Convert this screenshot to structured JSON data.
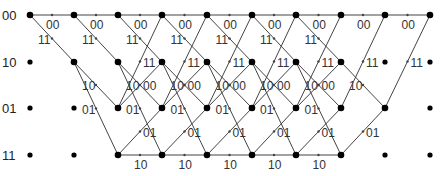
{
  "colors": {
    "line": "#444444",
    "node": "#000000",
    "text": "#333333"
  },
  "states": [
    "00",
    "10",
    "01",
    "11"
  ],
  "state_y": [
    15,
    62,
    108,
    155
  ],
  "columns_x": [
    30,
    74,
    118,
    162,
    207,
    252,
    296,
    341,
    385,
    430
  ],
  "transitions": [
    {
      "from": "00",
      "to": "00",
      "output": "00"
    },
    {
      "from": "00",
      "to": "10",
      "output": "11"
    },
    {
      "from": "10",
      "to": "01",
      "output": "10"
    },
    {
      "from": "10",
      "to": "11",
      "output": "01"
    },
    {
      "from": "01",
      "to": "00",
      "output": "11"
    },
    {
      "from": "01",
      "to": "10",
      "output": "00"
    },
    {
      "from": "11",
      "to": "01",
      "output": "01"
    },
    {
      "from": "11",
      "to": "11",
      "output": "10"
    }
  ],
  "tail_stages": 2
}
